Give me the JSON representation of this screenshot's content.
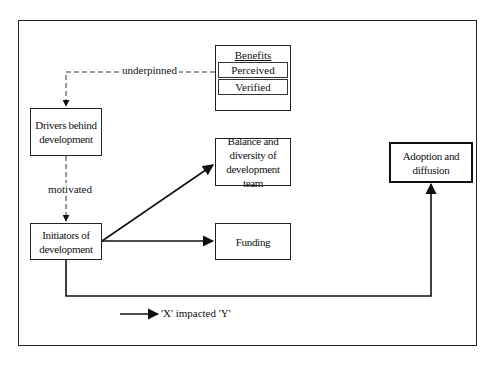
{
  "diagram": {
    "nodes": {
      "benefits": {
        "title": "Benefits",
        "items": [
          "Perceived",
          "Verified"
        ]
      },
      "drivers": "Drivers behind development",
      "initiators": "Initiators of development",
      "balance": "Balance and diversity of development team",
      "funding": "Funding",
      "adoption": "Adoption and diffusion"
    },
    "edges": [
      {
        "from": "benefits",
        "to": "drivers",
        "label": "underpinned",
        "style": "dashed"
      },
      {
        "from": "drivers",
        "to": "initiators",
        "label": "motivated",
        "style": "dashed"
      },
      {
        "from": "initiators",
        "to": "balance",
        "label": "",
        "style": "solid"
      },
      {
        "from": "initiators",
        "to": "funding",
        "label": "",
        "style": "solid"
      },
      {
        "from": "initiators",
        "to": "adoption",
        "label": "",
        "style": "solid"
      }
    ],
    "edge_labels": {
      "underpinned": "underpinned",
      "motivated": "motivated"
    },
    "legend": {
      "text": "'X' impacted 'Y'"
    },
    "colors": {
      "line": "#222222",
      "background": "#ffffff"
    }
  }
}
